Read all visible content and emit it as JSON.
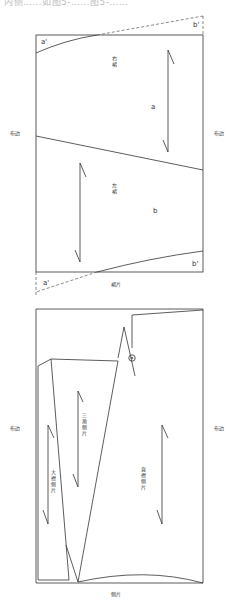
{
  "header": {
    "caption_fragment": "内侧……如图5-……图5-……"
  },
  "skirt_diagram": {
    "selvage_left": "布边",
    "selvage_right": "布边",
    "right_skirt": "右裙",
    "left_skirt": "左裙",
    "point_a": "a",
    "point_b": "b",
    "point_a_prime_top": "a'",
    "point_b_prime_top": "b'",
    "point_a_prime_bottom": "a'",
    "point_b_prime_bottom": "b'",
    "title": "裙片"
  },
  "side_panel_diagram": {
    "selvage_left": "布边",
    "selvage_right": "布边",
    "triangle_panel": "三角侧片",
    "large_panel": "大襟侧片",
    "straight_panel": "直襟侧片",
    "title": "侧片"
  },
  "colors": {
    "line": "#333333",
    "text": "#333333",
    "dashed": "#555555"
  }
}
